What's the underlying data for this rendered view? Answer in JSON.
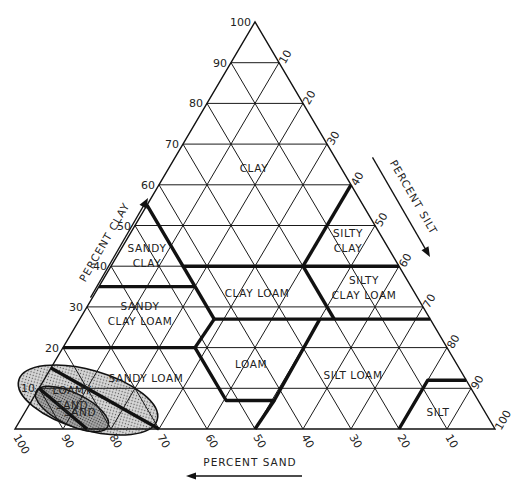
{
  "chart_data": {
    "type": "ternary",
    "axes": {
      "clay": {
        "label": "PERCENT CLAY",
        "ticks": [
          10,
          20,
          30,
          40,
          50,
          60,
          70,
          80,
          90,
          100
        ],
        "side": "left",
        "direction": "up"
      },
      "silt": {
        "label": "PERCENT SILT",
        "ticks": [
          10,
          20,
          30,
          40,
          50,
          60,
          70,
          80,
          90,
          100
        ],
        "side": "right",
        "direction": "down"
      },
      "sand": {
        "label": "PERCENT SAND",
        "ticks": [
          100,
          90,
          80,
          70,
          60,
          50,
          40,
          30,
          20,
          10
        ],
        "side": "bottom",
        "direction": "left"
      }
    },
    "grid": {
      "step": 10,
      "on": true
    },
    "regions": [
      {
        "name": "CLAY",
        "label_lines": [
          "CLAY"
        ]
      },
      {
        "name": "SANDY CLAY",
        "label_lines": [
          "SANDY",
          "CLAY"
        ]
      },
      {
        "name": "SILTY CLAY",
        "label_lines": [
          "SILTY",
          "CLAY"
        ]
      },
      {
        "name": "CLAY LOAM",
        "label_lines": [
          "CLAY LOAM"
        ]
      },
      {
        "name": "SILTY CLAY LOAM",
        "label_lines": [
          "SILTY",
          "CLAY LOAM"
        ]
      },
      {
        "name": "SANDY CLAY LOAM",
        "label_lines": [
          "SANDY",
          "CLAY LOAM"
        ]
      },
      {
        "name": "LOAM",
        "label_lines": [
          "LOAM"
        ]
      },
      {
        "name": "SILT LOAM",
        "label_lines": [
          "SILT LOAM"
        ]
      },
      {
        "name": "SANDY LOAM",
        "label_lines": [
          "SANDY LOAM"
        ]
      },
      {
        "name": "LOAMY SAND",
        "label_lines": [
          "LOAMY",
          "SAND"
        ]
      },
      {
        "name": "SAND",
        "label_lines": [
          "SAND"
        ]
      },
      {
        "name": "SILT",
        "label_lines": [
          "SILT"
        ]
      }
    ],
    "boundaries": [
      {
        "name": "clay-lower",
        "points_sand_silt_clay": [
          [
            45,
            0,
            55
          ],
          [
            45,
            15,
            40
          ],
          [
            20,
            40,
            40
          ],
          [
            0,
            60,
            40
          ]
        ]
      },
      {
        "name": "silty-clay-left",
        "points_sand_silt_clay": [
          [
            20,
            40,
            40
          ],
          [
            0,
            40,
            60
          ]
        ]
      },
      {
        "name": "sandy-clay-lower",
        "points_sand_silt_clay": [
          [
            65,
            0,
            35
          ],
          [
            45,
            20,
            35
          ]
        ]
      },
      {
        "name": "clay-loam-lower",
        "points_sand_silt_clay": [
          [
            45,
            28,
            27
          ],
          [
            45,
            15,
            40
          ]
        ]
      },
      {
        "name": "27-line",
        "points_sand_silt_clay": [
          [
            45,
            28,
            27
          ],
          [
            0,
            73,
            27
          ]
        ]
      },
      {
        "name": "silty-clay-loam-left",
        "points_sand_silt_clay": [
          [
            20,
            53,
            27
          ],
          [
            20,
            40,
            40
          ]
        ]
      },
      {
        "name": "scl-lower",
        "points_sand_silt_clay": [
          [
            80,
            0,
            20
          ],
          [
            52.5,
            27.5,
            20
          ]
        ]
      },
      {
        "name": "loam-left",
        "points_sand_silt_clay": [
          [
            52.5,
            27.5,
            20
          ],
          [
            45,
            28,
            27
          ]
        ]
      },
      {
        "name": "loam-lower",
        "points_sand_silt_clay": [
          [
            52.5,
            27.5,
            20
          ],
          [
            52.5,
            40.5,
            7
          ],
          [
            42.5,
            50.5,
            7
          ],
          [
            23,
            50,
            27
          ]
        ]
      },
      {
        "name": "silt-loam-left",
        "points_sand_silt_clay": [
          [
            42.5,
            50.5,
            7
          ],
          [
            50,
            50,
            0
          ]
        ]
      },
      {
        "name": "silt-boundary",
        "points_sand_silt_clay": [
          [
            20,
            80,
            0
          ],
          [
            8,
            80,
            12
          ],
          [
            0,
            88,
            12
          ]
        ]
      },
      {
        "name": "sandy-loam-left-upper",
        "points_sand_silt_clay": [
          [
            85,
            0,
            15
          ],
          [
            70,
            30,
            0
          ]
        ]
      },
      {
        "name": "loamy-sand-left",
        "points_sand_silt_clay": [
          [
            90,
            0,
            10
          ],
          [
            85,
            15,
            0
          ]
        ]
      }
    ]
  },
  "labels": {
    "clay_axis": "PERCENT CLAY",
    "silt_axis": "PERCENT SILT",
    "sand_axis": "PERCENT SAND"
  },
  "colors": {
    "line": "#111111",
    "shade": "#c8c8c8",
    "background": "#ffffff"
  }
}
